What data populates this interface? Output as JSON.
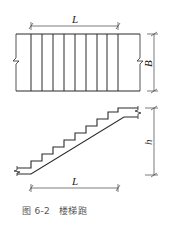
{
  "figure": {
    "caption_prefix": "图 6-2",
    "caption_title": "楼梯跑",
    "line_color": "#2a2a2a",
    "dim_color": "#444444"
  },
  "plan_view": {
    "length_label": "L",
    "width_label": "B",
    "tread_count": 9
  },
  "section_view": {
    "length_label": "L",
    "height_label": "h",
    "step_count": 10
  }
}
